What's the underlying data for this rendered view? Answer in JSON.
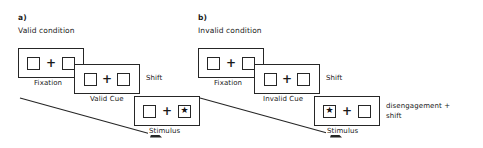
{
  "figure": {
    "type": "experimental-paradigm-diagram",
    "stroke_color": "#262626",
    "background_color": "#ffffff"
  },
  "panels": [
    {
      "id": "a",
      "letter": "a)",
      "title": "Valid condition",
      "frames": [
        {
          "stage": "fixation",
          "label": "Fixation",
          "content": {
            "left_box": "empty",
            "center": "+",
            "right_box": "empty",
            "arrow": "none"
          }
        },
        {
          "stage": "cue",
          "label": "Valid Cue",
          "side_label": "Shift",
          "content": {
            "left_box": "empty",
            "center": "+",
            "right_box": "empty",
            "arrow": "right"
          }
        },
        {
          "stage": "stimulus",
          "label": "Stimulus",
          "content": {
            "left_box": "empty",
            "center": "+",
            "right_box": "star",
            "arrow": "none"
          }
        }
      ],
      "time_arrow": {
        "direction": "down-right",
        "label": ""
      }
    },
    {
      "id": "b",
      "letter": "b)",
      "title": "Invalid condition",
      "frames": [
        {
          "stage": "fixation",
          "label": "Fixation",
          "content": {
            "left_box": "empty",
            "center": "+",
            "right_box": "empty",
            "arrow": "none"
          }
        },
        {
          "stage": "cue",
          "label": "Invalid Cue",
          "side_label": "Shift",
          "content": {
            "left_box": "empty",
            "center": "+",
            "right_box": "empty",
            "arrow": "right"
          }
        },
        {
          "stage": "stimulus",
          "label": "Stimulus",
          "side_label_line1": "disengagement +",
          "side_label_line2": "shift",
          "content": {
            "left_box": "star",
            "center": "+",
            "right_box": "empty",
            "arrow": "none"
          }
        }
      ],
      "time_arrow": {
        "direction": "down-right",
        "label": ""
      }
    }
  ],
  "glyphs": {
    "plus": "+",
    "star": "★"
  }
}
